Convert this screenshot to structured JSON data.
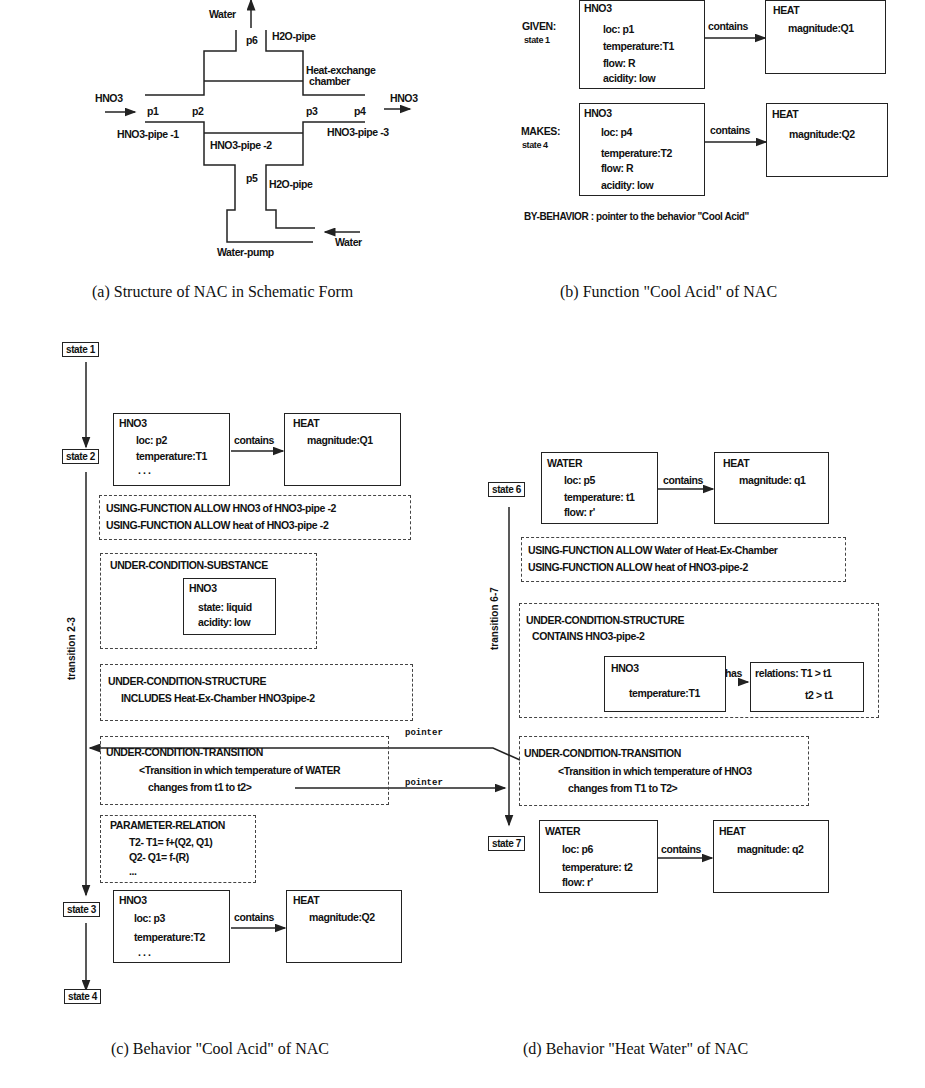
{
  "panel_a": {
    "caption": "(a) Structure of NAC in Schematic Form",
    "labels": {
      "water_out": "Water",
      "p6": "p6",
      "h2o_pipe_top": "H2O-pipe",
      "chamber_1": "Heat-exchange",
      "chamber_2": "chamber",
      "hno3_in": "HNO3",
      "hno3_out": "HNO3",
      "p1": "p1",
      "p2": "p2",
      "p3": "p3",
      "p4": "p4",
      "pipe1": "HNO3-pipe -1",
      "pipe2": "HNO3-pipe -2",
      "pipe3": "HNO3-pipe -3",
      "p5": "p5",
      "h2o_pipe_bottom": "H2O-pipe",
      "water_in": "Water",
      "water_pump": "Water-pump"
    }
  },
  "panel_b": {
    "caption": "(b) Function \"Cool Acid\" of NAC",
    "given_label": "GIVEN:",
    "given_state": "state 1",
    "makes_label": "MAKES:",
    "makes_state": "state 4",
    "given_substance": {
      "title": "HNO3",
      "lines": [
        "loc: p1",
        "temperature:T1",
        "flow: R",
        "acidity: low"
      ]
    },
    "given_heat": {
      "title": "HEAT",
      "lines": [
        "magnitude:Q1"
      ]
    },
    "makes_substance": {
      "title": "HNO3",
      "lines": [
        "loc: p4",
        "temperature:T2",
        "flow: R",
        "acidity: low"
      ]
    },
    "makes_heat": {
      "title": "HEAT",
      "lines": [
        "magnitude:Q2"
      ]
    },
    "relation": "contains",
    "by_behavior": "BY-BEHAVIOR  :  pointer to the behavior \"Cool Acid\""
  },
  "panel_c": {
    "caption": "(c) Behavior \"Cool Acid\" of NAC",
    "states": [
      "state 1",
      "state 2",
      "state 3",
      "state 4"
    ],
    "transition_label": "transition 2-3",
    "state2_substance": {
      "title": "HNO3",
      "lines": [
        "loc: p2",
        "temperature:T1",
        ". . ."
      ]
    },
    "state2_heat": {
      "title": "HEAT",
      "lines": [
        "magnitude:Q1"
      ]
    },
    "relation": "contains",
    "using_function": [
      "USING-FUNCTION    ALLOW  HNO3 of  HNO3-pipe  -2",
      "USING-FUNCTION    ALLOW  heat of  HNO3-pipe  -2"
    ],
    "ucs_title": "UNDER-CONDITION-SUBSTANCE",
    "ucs_inner": {
      "title": "HNO3",
      "lines": [
        "state: liquid",
        "acidity: low"
      ]
    },
    "ucstr_title": "UNDER-CONDITION-STRUCTURE",
    "ucstr_line": "INCLUDES   Heat-Ex-Chamber      HNO3pipe-2",
    "uct_title": "UNDER-CONDITION-TRANSITION",
    "uct_lines": [
      "<Transition in which temperature of    WATER",
      "changes from  t1 to  t2>"
    ],
    "pr_title": "PARAMETER-RELATION",
    "pr_lines": [
      "T2- T1= f+(Q2, Q1)",
      "Q2- Q1= f-(R)",
      "..."
    ],
    "state3_substance": {
      "title": "HNO3",
      "lines": [
        "loc: p3",
        "temperature:T2",
        ". . ."
      ]
    },
    "state3_heat": {
      "title": "HEAT",
      "lines": [
        "magnitude:Q2"
      ]
    },
    "pointer_top": "pointer",
    "pointer_bottom": "pointer"
  },
  "panel_d": {
    "caption": "(d) Behavior \"Heat Water\" of NAC",
    "states": [
      "state 6",
      "state 7"
    ],
    "transition_label": "transition 6-7",
    "state6_substance": {
      "title": "WATER",
      "lines": [
        "loc: p5",
        "temperature: t1",
        "flow: r'"
      ]
    },
    "state6_heat": {
      "title": "HEAT",
      "lines": [
        "magnitude: q1"
      ]
    },
    "relation": "contains",
    "using_function": [
      "USING-FUNCTION    ALLOW  Water of Heat-Ex-Chamber",
      "USING-FUNCTION    ALLOW  heat of   HNO3-pipe-2"
    ],
    "ucstr_title": "UNDER-CONDITION-STRUCTURE",
    "ucstr_line": "CONTAINS    HNO3-pipe-2",
    "ucstr_inner": {
      "title": "HNO3",
      "lines": [
        "temperature:T1"
      ]
    },
    "has_label": "has",
    "relations": {
      "title": "relations:  T1 >  t1",
      "line2": "t2 >  t1"
    },
    "uct_title": "UNDER-CONDITION-TRANSITION",
    "uct_lines": [
      "<Transition in which temperature of    HNO3",
      "changes from  T1 to  T2>"
    ],
    "state7_substance": {
      "title": "WATER",
      "lines": [
        "loc: p6",
        "temperature: t2",
        "flow: r'"
      ]
    },
    "state7_heat": {
      "title": "HEAT",
      "lines": [
        "magnitude: q2"
      ]
    }
  }
}
